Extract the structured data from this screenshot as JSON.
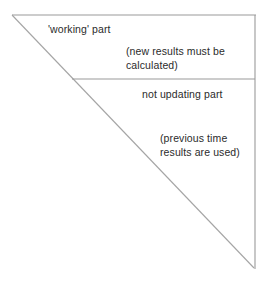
{
  "figure": {
    "type": "line-diagram",
    "background_color": "#ffffff",
    "stroke_color": "#9a9a9a",
    "text_color": "#2b2b2b",
    "geometry": {
      "top_edge": {
        "x1": 12,
        "y1": 15,
        "x2": 256,
        "y2": 15
      },
      "right_edge": {
        "x1": 255,
        "y1": 15,
        "x2": 255,
        "y2": 269
      },
      "hypotenuse": {
        "x1": 12,
        "y1": 15,
        "x2": 254,
        "y2": 268
      },
      "divider": {
        "x1": 72,
        "y1": 79,
        "x2": 255,
        "y2": 79
      }
    },
    "labels": {
      "working_part": "'working' part",
      "new_results_line1": "(new results must be",
      "new_results_line2": "calculated)",
      "not_updating_part": "not updating part",
      "previous_time_line1": "(previous time",
      "previous_time_line2": "results are used)"
    }
  }
}
